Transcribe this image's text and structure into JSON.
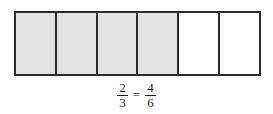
{
  "figure": {
    "bar_model": {
      "total_parts": 6,
      "shaded_parts": 4,
      "cells": [
        {
          "index": 1,
          "shaded": true
        },
        {
          "index": 2,
          "shaded": true
        },
        {
          "index": 3,
          "shaded": true
        },
        {
          "index": 4,
          "shaded": true
        },
        {
          "index": 5,
          "shaded": false
        },
        {
          "index": 6,
          "shaded": false
        }
      ],
      "shaded_color": "#e3e3e3",
      "unshaded_color": "#ffffff",
      "border_color": "#2b2b2b"
    },
    "equation": {
      "left_fraction": {
        "numerator": "2",
        "denominator": "3"
      },
      "operator": "=",
      "right_fraction": {
        "numerator": "4",
        "denominator": "6"
      },
      "text": "2/3 = 4/6"
    }
  },
  "chart_data": {
    "type": "bar",
    "title": "",
    "categories": [
      "1",
      "2",
      "3",
      "4",
      "5",
      "6"
    ],
    "values": [
      1,
      1,
      1,
      1,
      1,
      1
    ],
    "shaded": [
      true,
      true,
      true,
      true,
      false,
      false
    ],
    "xlabel": "",
    "ylabel": "",
    "annotations": [
      "2/3 = 4/6"
    ]
  }
}
